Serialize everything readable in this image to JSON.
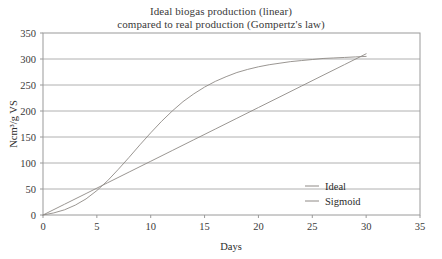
{
  "chart_data": {
    "type": "line",
    "title": "Ideal biogas production (linear) compared to real production (Gompertz's law)",
    "title_lines": [
      "Ideal biogas production (linear)",
      "compared to real production (Gompertz's law)"
    ],
    "xlabel": "Days",
    "ylabel": "Ncm³/g VS",
    "xlim": [
      0,
      35
    ],
    "ylim": [
      0,
      350
    ],
    "xticks": [
      0,
      5,
      10,
      15,
      20,
      25,
      30,
      35
    ],
    "yticks": [
      0,
      50,
      100,
      150,
      200,
      250,
      300,
      350
    ],
    "xtick_labels": [
      "0",
      "5",
      "10",
      "15",
      "20",
      "25",
      "30",
      "35"
    ],
    "ytick_labels": [
      "0",
      "50",
      "100",
      "150",
      "200",
      "250",
      "300",
      "350"
    ],
    "grid": "horizontal",
    "grid_color": "#b0b0b0",
    "frame_color": "#9a9a9a",
    "legend_position": "lower-right",
    "legend_entries": [
      "Ideal",
      "Sigmoid"
    ],
    "series": [
      {
        "name": "Ideal",
        "color": "#8f8a86",
        "x": [
          0,
          2,
          4,
          6,
          8,
          10,
          12,
          14,
          16,
          18,
          20,
          22,
          24,
          26,
          28,
          30
        ],
        "values": [
          0,
          20.7,
          41.3,
          62,
          82.7,
          103.3,
          124,
          144.7,
          165.3,
          186,
          206.7,
          227.3,
          248,
          268.7,
          289.3,
          310
        ]
      },
      {
        "name": "Sigmoid",
        "color": "#8f8a86",
        "x": [
          0,
          1,
          2,
          3,
          4,
          5,
          6,
          7,
          8,
          9,
          10,
          11,
          12,
          13,
          14,
          15,
          16,
          17,
          18,
          19,
          20,
          21,
          22,
          23,
          24,
          25,
          26,
          27,
          28,
          29,
          30
        ],
        "values": [
          0,
          4,
          10,
          19,
          31,
          47,
          66,
          88,
          111,
          135,
          158,
          180,
          200,
          218,
          233,
          246,
          257,
          266,
          274,
          280,
          285,
          289,
          292,
          295,
          297,
          299,
          301,
          302,
          303,
          304,
          305
        ]
      }
    ]
  },
  "legend": {
    "items": [
      {
        "label": "Ideal",
        "color": "#8f8a86"
      },
      {
        "label": "Sigmoid",
        "color": "#8f8a86"
      }
    ]
  },
  "axes": {
    "x_title": "Days",
    "y_title": "Ncm³/g VS"
  }
}
